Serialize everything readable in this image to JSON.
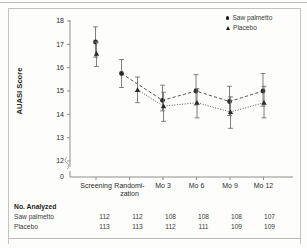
{
  "figure": {
    "ylabel": "AUASI Score",
    "legend": [
      {
        "label": "Saw palmetto",
        "marker": "circle-marker-icon"
      },
      {
        "label": "Placebo",
        "marker": "triangle-marker-icon"
      }
    ]
  },
  "table": {
    "title": "No. Analyzed",
    "rows": [
      {
        "label": "Saw palmetto",
        "values": [
          "112",
          "112",
          "108",
          "108",
          "108",
          "107"
        ]
      },
      {
        "label": "Placebo",
        "values": [
          "113",
          "113",
          "112",
          "111",
          "109",
          "109"
        ]
      }
    ]
  },
  "axis": {
    "y_ticks": [
      "18",
      "17",
      "16",
      "15",
      "14",
      "13",
      "12"
    ],
    "y_zero": "0",
    "x_ticks": [
      "Screening",
      "Randomi-",
      "Mo 3",
      "Mo 6",
      "Mo 9",
      "Mo 12"
    ],
    "x_tick_second_line": "zation"
  },
  "chart_data": {
    "type": "line",
    "title": "",
    "xlabel": "",
    "ylabel": "AUASI Score",
    "ylim": [
      12,
      18
    ],
    "y_ticks": [
      12,
      13,
      14,
      15,
      16,
      17,
      18
    ],
    "y_axis_break": true,
    "y_break_label": "0",
    "grid": false,
    "legend_position": "top-right",
    "categories": [
      "Screening",
      "Randomization",
      "Mo 3",
      "Mo 6",
      "Mo 9",
      "Mo 12"
    ],
    "series": [
      {
        "name": "Saw palmetto",
        "marker": "circle",
        "line_style": "dashed",
        "values": [
          17.1,
          15.75,
          14.6,
          15.0,
          14.55,
          15.0
        ],
        "error_low": [
          16.45,
          15.15,
          14.15,
          14.4,
          13.95,
          14.35
        ],
        "error_high": [
          17.75,
          16.35,
          15.25,
          15.7,
          15.2,
          15.75
        ]
      },
      {
        "name": "Placebo",
        "marker": "triangle",
        "line_style": "dotted",
        "values": [
          16.6,
          15.05,
          14.35,
          14.5,
          14.1,
          14.5
        ],
        "error_low": [
          16.05,
          14.5,
          13.7,
          13.85,
          13.4,
          13.85
        ],
        "error_high": [
          17.1,
          15.6,
          14.95,
          15.1,
          14.75,
          15.2
        ]
      }
    ]
  }
}
